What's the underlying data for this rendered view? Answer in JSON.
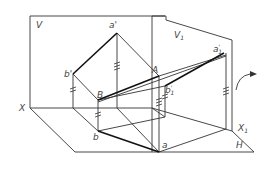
{
  "diagram": {
    "type": "descriptive-geometry projection (change of projection plane)",
    "planes": {
      "V": "V",
      "V1": "V",
      "V1_sub": "1",
      "H": "H"
    },
    "axes": {
      "X": "X",
      "X1": "X",
      "X1_sub": "1"
    },
    "points": {
      "a_prime": "a'",
      "b_prime": "b'",
      "A": "A",
      "B": "B",
      "a": "a",
      "b": "b",
      "a1_prime": "a",
      "a1_prime_sup": "'",
      "a1_prime_sub": "1",
      "b1_prime": "b",
      "b1_prime_sup": "'",
      "b1_prime_sub": "1"
    },
    "colors": {
      "line": "#333333",
      "bold": "#111111",
      "label": "#444444"
    }
  }
}
